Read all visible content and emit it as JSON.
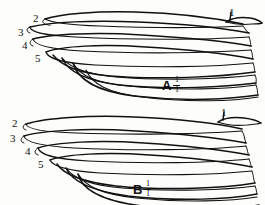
{
  "plate": {
    "background_color": "#fdfdfb",
    "ink_color": "#111111"
  },
  "figures": [
    {
      "id": "A",
      "caption_letter": "A",
      "scale_numerator": "1",
      "scale_denominator": "1",
      "labels": [
        {
          "text": "1",
          "x": 229,
          "y": 7
        },
        {
          "text": "2",
          "x": 33,
          "y": 13
        },
        {
          "text": "3",
          "x": 18,
          "y": 27
        },
        {
          "text": "4",
          "x": 22,
          "y": 40
        },
        {
          "text": "5",
          "x": 35,
          "y": 53
        }
      ]
    },
    {
      "id": "B",
      "caption_letter": "B",
      "scale_numerator": "1",
      "scale_denominator": "1",
      "labels": [
        {
          "text": "1",
          "x": 221,
          "y": 5
        },
        {
          "text": "2",
          "x": 12,
          "y": 16
        },
        {
          "text": "3",
          "x": 10,
          "y": 31
        },
        {
          "text": "4",
          "x": 25,
          "y": 44
        },
        {
          "text": "5",
          "x": 38,
          "y": 57
        }
      ]
    }
  ]
}
